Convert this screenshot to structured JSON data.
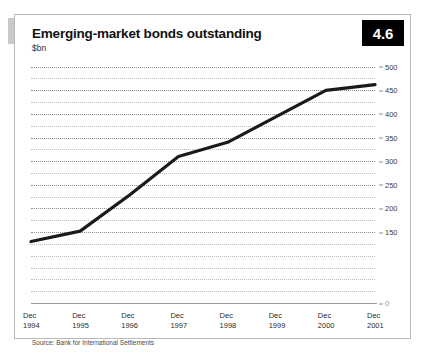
{
  "figure": {
    "title": "Emerging-market bonds outstanding",
    "unit": "$bn",
    "badge": "4.6",
    "source": "Source: Bank for International Settlements"
  },
  "colors": {
    "line": "#1a1a1a",
    "grid": "#8e8e8e",
    "badge_bg": "#000000",
    "badge_text": "#ffffff",
    "frame": "#b9b9b9"
  },
  "chart_data": {
    "type": "line",
    "title": "Emerging-market bonds outstanding",
    "subtitle": "$bn",
    "xlabel": "",
    "ylabel": "$bn",
    "categories": [
      "Dec 1994",
      "Dec 1995",
      "Dec 1996",
      "Dec 1997",
      "Dec 1998",
      "Dec 1999",
      "Dec 2000",
      "Dec 2001"
    ],
    "x_tick_lines": [
      [
        "Dec",
        "1994"
      ],
      [
        "Dec",
        "1995"
      ],
      [
        "Dec",
        "1996"
      ],
      [
        "Dec",
        "1997"
      ],
      [
        "Dec",
        "1998"
      ],
      [
        "Dec",
        "1999"
      ],
      [
        "Dec",
        "2000"
      ],
      [
        "Dec",
        "2001"
      ]
    ],
    "values": [
      130,
      152,
      228,
      310,
      340,
      395,
      450,
      462
    ],
    "ylim": [
      0,
      512
    ],
    "y_ticks": [
      500,
      450,
      400,
      350,
      300,
      250,
      200,
      150,
      0
    ],
    "y_tick_labels": [
      "500",
      "450",
      "400",
      "350",
      "300",
      "250",
      "200",
      "150",
      "0"
    ],
    "y_minor_step": 25,
    "grid": true,
    "legend": "none"
  }
}
